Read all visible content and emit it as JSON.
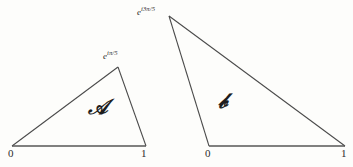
{
  "figure": {
    "background_color": "#fdfdfb",
    "line_color": "#4a4a4a",
    "text_color": "#2c2c2c"
  },
  "triangles": [
    {
      "id": "triangle-a",
      "region_label": "ᴀ",
      "region_label_display": "𝒜",
      "vertices": [
        {
          "name": "origin",
          "label": "0",
          "x": 12,
          "y": 146
        },
        {
          "name": "unit",
          "label": "1",
          "x": 146,
          "y": 146
        },
        {
          "name": "apex",
          "label": "e^{iπ/5}",
          "x": 118,
          "y": 67
        }
      ],
      "apex_base": "e",
      "apex_exponent": "iπ/5"
    },
    {
      "id": "triangle-b",
      "region_label": "ʙ",
      "region_label_display": "𝒷",
      "vertices": [
        {
          "name": "origin",
          "label": "0",
          "x": 209,
          "y": 146
        },
        {
          "name": "unit",
          "label": "1",
          "x": 345,
          "y": 146
        },
        {
          "name": "apex",
          "label": "e^{i3π/5}",
          "x": 169,
          "y": 16
        }
      ],
      "apex_base": "e",
      "apex_exponent": "i3π/5"
    }
  ],
  "labels": {
    "a_origin": "0",
    "a_unit": "1",
    "b_origin": "0",
    "b_unit": "1",
    "a_apex_base": "e",
    "a_apex_exp": "iπ/5",
    "b_apex_base": "e",
    "b_apex_exp": "i3π/5",
    "region_a": "𝒜",
    "region_b": "𝒷"
  }
}
